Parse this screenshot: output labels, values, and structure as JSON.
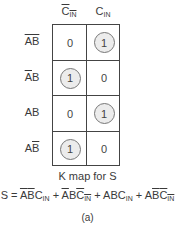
{
  "kmap": {
    "columns": [
      {
        "var": "C",
        "sub": "IN",
        "complement": true
      },
      {
        "var": "C",
        "sub": "IN",
        "complement": false
      }
    ],
    "rows": [
      {
        "a": "A",
        "a_bar": true,
        "b": "B",
        "b_bar": true
      },
      {
        "a": "A",
        "a_bar": true,
        "b": "B",
        "b_bar": false
      },
      {
        "a": "A",
        "a_bar": false,
        "b": "B",
        "b_bar": false
      },
      {
        "a": "A",
        "a_bar": false,
        "b": "B",
        "b_bar": true
      }
    ],
    "values": [
      [
        "0",
        "1"
      ],
      [
        "1",
        "0"
      ],
      [
        "0",
        "1"
      ],
      [
        "1",
        "0"
      ]
    ],
    "circled": [
      [
        false,
        true
      ],
      [
        true,
        false
      ],
      [
        false,
        true
      ],
      [
        true,
        false
      ]
    ]
  },
  "caption": "K map for S",
  "equation": {
    "lhs": "S",
    "terms": [
      [
        {
          "t": "A",
          "bar": true
        },
        {
          "t": "B",
          "bar": true
        },
        {
          "t": "C",
          "sub": "IN",
          "bar": false
        }
      ],
      [
        {
          "t": "A",
          "bar": true
        },
        {
          "t": "B",
          "bar": false
        },
        {
          "t": "C",
          "sub": "IN",
          "bar": true
        }
      ],
      [
        {
          "t": "A",
          "bar": false
        },
        {
          "t": "B",
          "bar": false
        },
        {
          "t": "C",
          "sub": "IN",
          "bar": false
        }
      ],
      [
        {
          "t": "A",
          "bar": false
        },
        {
          "t": "B",
          "bar": true
        },
        {
          "t": "C",
          "sub": "IN",
          "bar": true
        }
      ]
    ]
  },
  "figure_label": "(a)"
}
